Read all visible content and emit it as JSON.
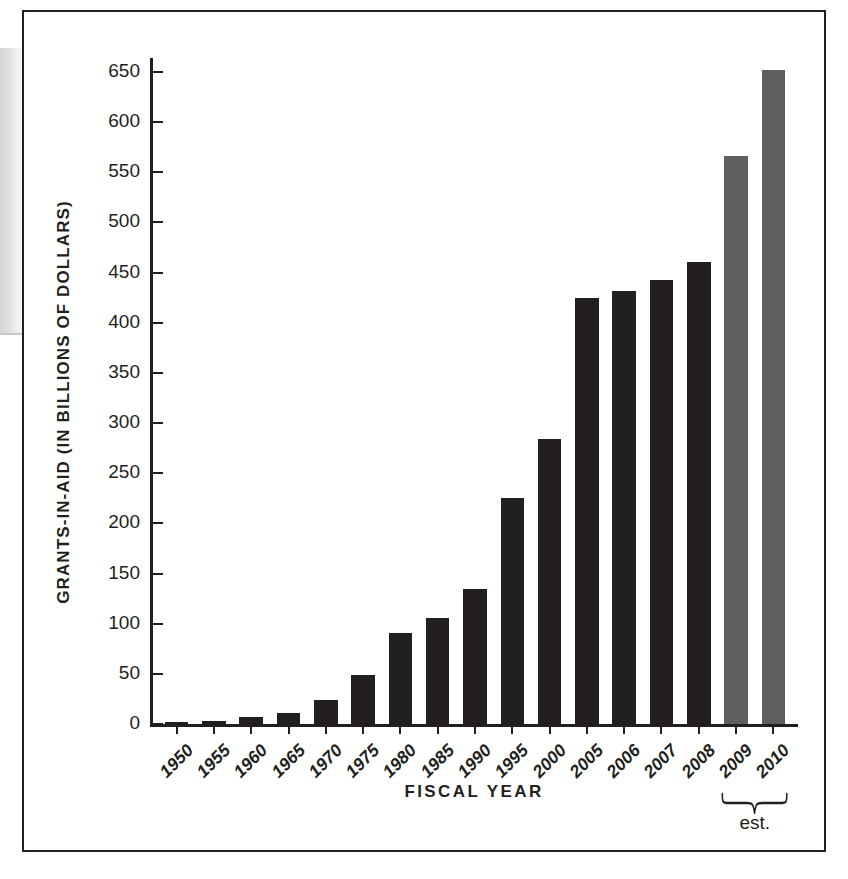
{
  "figure": {
    "background_color": "#ffffff",
    "frame_color": "#231f20"
  },
  "chart_data": {
    "type": "bar",
    "title": "",
    "xlabel": "FISCAL YEAR",
    "ylabel": "GRANTS-IN-AID (IN BILLIONS OF DOLLARS)",
    "categories": [
      "1950",
      "1955",
      "1960",
      "1965",
      "1970",
      "1975",
      "1980",
      "1985",
      "1990",
      "1995",
      "2000",
      "2005",
      "2006",
      "2007",
      "2008",
      "2009",
      "2010"
    ],
    "values": [
      2,
      3,
      7,
      11,
      24,
      49,
      91,
      106,
      135,
      225,
      284,
      425,
      432,
      443,
      461,
      566,
      652
    ],
    "series": [
      {
        "name": "Grants-in-aid",
        "values": [
          2,
          3,
          7,
          11,
          24,
          49,
          91,
          106,
          135,
          225,
          284,
          425,
          432,
          443,
          461,
          566,
          652
        ]
      }
    ],
    "bar_kinds": [
      "actual",
      "actual",
      "actual",
      "actual",
      "actual",
      "actual",
      "actual",
      "actual",
      "actual",
      "actual",
      "actual",
      "actual",
      "actual",
      "actual",
      "actual",
      "estimate",
      "estimate"
    ],
    "colors": {
      "actual": "#231f20",
      "estimate": "#5e5e5e",
      "axis": "#231f20",
      "text": "#231f20"
    },
    "ylim": [
      0,
      680
    ],
    "yticks": [
      0,
      50,
      100,
      150,
      200,
      250,
      300,
      350,
      400,
      450,
      500,
      550,
      600,
      650
    ],
    "ytick_labels": [
      "0",
      "50",
      "100",
      "150",
      "200",
      "250",
      "300",
      "350",
      "400",
      "450",
      "500",
      "550",
      "600",
      "650"
    ],
    "grid": false,
    "legend": "none",
    "annotations": [
      {
        "name": "estimate-bracket",
        "text": "est.",
        "covers": [
          "2009",
          "2010"
        ]
      }
    ]
  }
}
